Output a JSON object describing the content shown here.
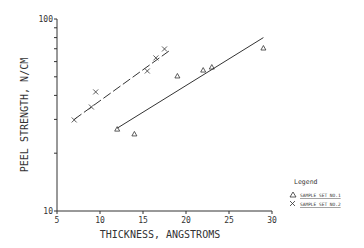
{
  "chart_data": {
    "type": "scatter",
    "title": "",
    "xlabel": "THICKNESS, ANGSTROMS",
    "ylabel": "PEEL STRENGTH, N/CM",
    "xlim": [
      5,
      30
    ],
    "ylim": [
      10,
      100
    ],
    "yscale": "log",
    "xticks": [
      5,
      10,
      15,
      20,
      25,
      30
    ],
    "yticks_labeled": [
      10,
      100
    ],
    "grid": false,
    "legend_position": "lower right (outside)",
    "legend_title": "Legend",
    "series": [
      {
        "name": "SAMPLE SET NO.1",
        "marker": "triangle",
        "points": [
          [
            12,
            26.7
          ],
          [
            14,
            25.2
          ],
          [
            19,
            50.5
          ],
          [
            22,
            54.2
          ],
          [
            23,
            56.2
          ],
          [
            29,
            70.6
          ]
        ],
        "fit_line": {
          "style": "solid",
          "from": [
            12,
            27
          ],
          "to": [
            29,
            80
          ]
        }
      },
      {
        "name": "SAMPLE SET NO.2",
        "marker": "x",
        "points": [
          [
            7,
            29.8
          ],
          [
            9,
            34.8
          ],
          [
            9.5,
            41.7
          ],
          [
            15.5,
            53.6
          ],
          [
            16.5,
            62.7
          ],
          [
            17.5,
            69.8
          ]
        ],
        "fit_line": {
          "style": "dashed",
          "from": [
            7,
            30
          ],
          "to": [
            18,
            68
          ]
        }
      }
    ]
  },
  "labels": {
    "xlabel": "THICKNESS, ANGSTROMS",
    "ylabel": "PEEL STRENGTH, N/CM",
    "legend_title": "Legend",
    "legend_1": "SAMPLE SET NO.1",
    "legend_2": "SAMPLE SET NO.2",
    "y_top": "100",
    "y_bottom": "10",
    "x_ticks": [
      "5",
      "10",
      "15",
      "20",
      "25",
      "30"
    ]
  }
}
